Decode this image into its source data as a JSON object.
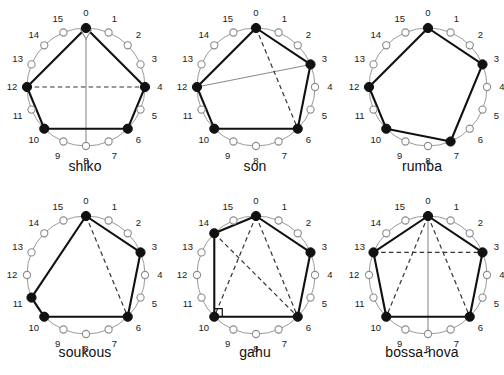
{
  "figure": {
    "title": "",
    "node_count": 16,
    "tick_labels": [
      "0",
      "1",
      "2",
      "3",
      "4",
      "5",
      "6",
      "7",
      "8",
      "9",
      "10",
      "11",
      "12",
      "13",
      "14",
      "15"
    ],
    "colors": {
      "onset_fill": "#111111",
      "rest_fill": "#ffffff",
      "rest_stroke": "#8c8c8c",
      "chord_solid": "#111111",
      "chord_dashed": "#333333",
      "chord_thin": "#8c8c8c",
      "circle_stroke": "#9a9a9a",
      "label_text": "#1a1a1a",
      "caption_text": "#111111"
    },
    "geometry": {
      "center_x": 86,
      "center_y": 87,
      "node_radius": 59,
      "label_radius": 74,
      "onset_dot_r": 4.6,
      "rest_dot_r": 3.6
    }
  },
  "panels": [
    {
      "name": "shiko",
      "caption": "shiko",
      "onsets": [
        0,
        4,
        6,
        10,
        12
      ],
      "solid_chords": [
        [
          0,
          4
        ],
        [
          4,
          6
        ],
        [
          6,
          10
        ],
        [
          10,
          12
        ],
        [
          12,
          0
        ]
      ],
      "dashed_chords": [
        [
          12,
          4
        ]
      ],
      "thin_chords": [
        [
          0,
          8
        ]
      ],
      "right_angle_at": null,
      "arrow_from": 0
    },
    {
      "name": "son",
      "caption": "son",
      "onsets": [
        0,
        3,
        6,
        10,
        12
      ],
      "solid_chords": [
        [
          0,
          3
        ],
        [
          3,
          6
        ],
        [
          6,
          10
        ],
        [
          10,
          12
        ],
        [
          12,
          0
        ]
      ],
      "dashed_chords": [
        [
          0,
          6
        ]
      ],
      "thin_chords": [
        [
          12,
          3
        ]
      ],
      "right_angle_at": null,
      "arrow_from": null
    },
    {
      "name": "rumba",
      "caption": "rumba",
      "onsets": [
        0,
        3,
        7,
        10,
        12
      ],
      "solid_chords": [
        [
          0,
          3
        ],
        [
          3,
          7
        ],
        [
          7,
          10
        ],
        [
          10,
          12
        ],
        [
          12,
          0
        ]
      ],
      "dashed_chords": [],
      "thin_chords": [],
      "right_angle_at": null,
      "arrow_from": null
    },
    {
      "name": "soukous",
      "caption": "soukous",
      "onsets": [
        0,
        3,
        6,
        10,
        11
      ],
      "solid_chords": [
        [
          0,
          3
        ],
        [
          3,
          6
        ],
        [
          6,
          10
        ],
        [
          10,
          11
        ],
        [
          11,
          0
        ]
      ],
      "dashed_chords": [
        [
          0,
          6
        ]
      ],
      "thin_chords": [],
      "right_angle_at": null,
      "arrow_from": null
    },
    {
      "name": "gahu",
      "caption": "gahu",
      "onsets": [
        0,
        3,
        6,
        10,
        14
      ],
      "solid_chords": [
        [
          0,
          3
        ],
        [
          3,
          6
        ],
        [
          6,
          10
        ],
        [
          10,
          14
        ],
        [
          14,
          0
        ]
      ],
      "dashed_chords": [
        [
          0,
          6
        ],
        [
          0,
          10
        ],
        [
          14,
          6
        ]
      ],
      "thin_chords": [],
      "right_angle_at": 10,
      "arrow_from": null
    },
    {
      "name": "bossa-nova",
      "caption": "bossa-nova",
      "onsets": [
        0,
        3,
        6,
        10,
        13
      ],
      "solid_chords": [
        [
          0,
          3
        ],
        [
          3,
          6
        ],
        [
          6,
          10
        ],
        [
          10,
          13
        ],
        [
          13,
          0
        ]
      ],
      "dashed_chords": [
        [
          13,
          3
        ],
        [
          0,
          6
        ],
        [
          0,
          10
        ]
      ],
      "thin_chords": [
        [
          0,
          8
        ]
      ],
      "right_angle_at": null,
      "arrow_from": null
    }
  ]
}
